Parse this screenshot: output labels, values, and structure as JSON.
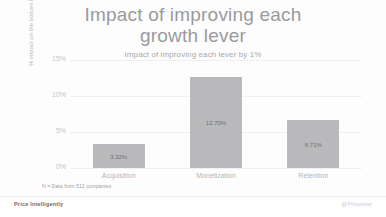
{
  "chart_data": {
    "type": "bar",
    "title": "Impact of improving each\ngrowth lever",
    "subtitle": "Impact of improving each lever by 1%",
    "xlabel": "",
    "ylabel": "% impact on the bottom line",
    "categories": [
      "Acquisition",
      "Monetization",
      "Retention"
    ],
    "values": [
      3.32,
      12.7,
      6.71
    ],
    "value_labels": [
      "3.32%",
      "12.70%",
      "6.71%"
    ],
    "ylim": [
      0,
      15
    ],
    "yticks": [
      0,
      5,
      10,
      15
    ],
    "ytick_labels": [
      "0%",
      "5%",
      "10%",
      "15%"
    ],
    "grid": true,
    "legend": "none",
    "bar_color": "#b9b9bb",
    "footnote": "N = Data from 512 companies"
  },
  "footer": {
    "brand": "Price Intelligently",
    "handle": "@Priceintel"
  }
}
